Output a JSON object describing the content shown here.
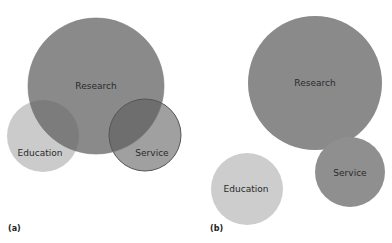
{
  "figure": {
    "panels": [
      {
        "id": "a",
        "label": "(a)",
        "circles": [
          {
            "name": "Research",
            "cx": 96,
            "cy": 86,
            "r": 68,
            "fill": "#8a8a8a",
            "opacity": 1
          },
          {
            "name": "Education",
            "cx": 43,
            "cy": 136,
            "r": 36,
            "fill": "#c8c8c8",
            "opacity": 1
          },
          {
            "name": "Service",
            "cx": 145,
            "cy": 135,
            "r": 36,
            "fill": "#a0a0a0",
            "opacity": 1
          }
        ],
        "labels": {
          "research": "Research",
          "education": "Education",
          "service": "Service"
        }
      },
      {
        "id": "b",
        "label": "(b)",
        "circles": [
          {
            "name": "Research",
            "cx": 315,
            "cy": 83,
            "r": 67,
            "fill": "#8a8a8a"
          },
          {
            "name": "Education",
            "cx": 247,
            "cy": 189,
            "r": 36,
            "fill": "#cccccc"
          },
          {
            "name": "Service",
            "cx": 350,
            "cy": 172,
            "r": 35,
            "fill": "#8f8f8f"
          }
        ],
        "labels": {
          "research": "Research",
          "education": "Education",
          "service": "Service"
        }
      }
    ]
  }
}
